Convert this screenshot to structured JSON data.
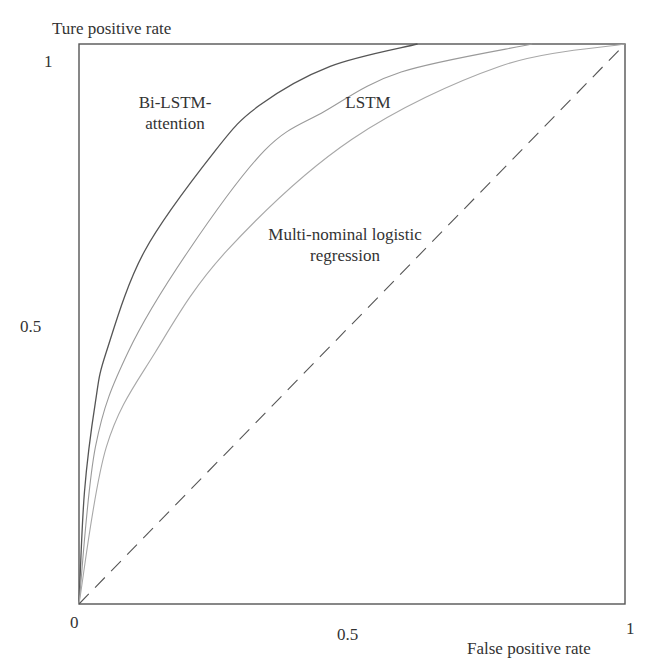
{
  "chart_data": {
    "type": "line",
    "title": "",
    "xlabel": "False positive rate",
    "ylabel": "Ture positive rate",
    "xlim": [
      0,
      1
    ],
    "ylim": [
      0,
      1
    ],
    "x_ticks": [
      "0",
      "0.5",
      "1"
    ],
    "y_ticks": [
      "0.5",
      "1"
    ],
    "grid": false,
    "legend": "inline annotations",
    "series": [
      {
        "name": "Bi-LSTM-attention",
        "color": "#555555",
        "style": "solid",
        "x": [
          0,
          0.01,
          0.03,
          0.05,
          0.12,
          0.25,
          0.33,
          0.46,
          0.62
        ],
        "y": [
          0,
          0.2,
          0.36,
          0.45,
          0.63,
          0.81,
          0.89,
          0.96,
          1.0
        ]
      },
      {
        "name": "LSTM",
        "color": "#9a9a9a",
        "style": "solid",
        "x": [
          0,
          0.03,
          0.09,
          0.2,
          0.34,
          0.45,
          0.59,
          0.83
        ],
        "y": [
          0,
          0.28,
          0.45,
          0.63,
          0.81,
          0.88,
          0.95,
          1.0
        ]
      },
      {
        "name": "Multi-nominal logistic regression",
        "color": "#a8a8a8",
        "style": "solid",
        "x": [
          0,
          0.05,
          0.14,
          0.27,
          0.5,
          0.77,
          1.0
        ],
        "y": [
          0,
          0.28,
          0.45,
          0.63,
          0.83,
          0.96,
          1.0
        ]
      },
      {
        "name": "Random (diagonal)",
        "color": "#555555",
        "style": "dashed",
        "x": [
          0,
          1
        ],
        "y": [
          0,
          1
        ]
      }
    ],
    "annotations": [
      {
        "text_line1": "Bi-LSTM-",
        "text_line2": "attention"
      },
      {
        "text_line1": "LSTM"
      },
      {
        "text_line1": "Multi-nominal logistic",
        "text_line2": "regression"
      }
    ]
  },
  "labels": {
    "ylabel": "Ture positive rate",
    "xlabel": "False positive rate",
    "x0": "0",
    "x05": "0.5",
    "x1": "1",
    "y05": "0.5",
    "y1": "1",
    "ann_bilstm_1": "Bi-LSTM-",
    "ann_bilstm_2": "attention",
    "ann_lstm": "LSTM",
    "ann_mlr_1": "Multi-nominal logistic",
    "ann_mlr_2": "regression"
  }
}
